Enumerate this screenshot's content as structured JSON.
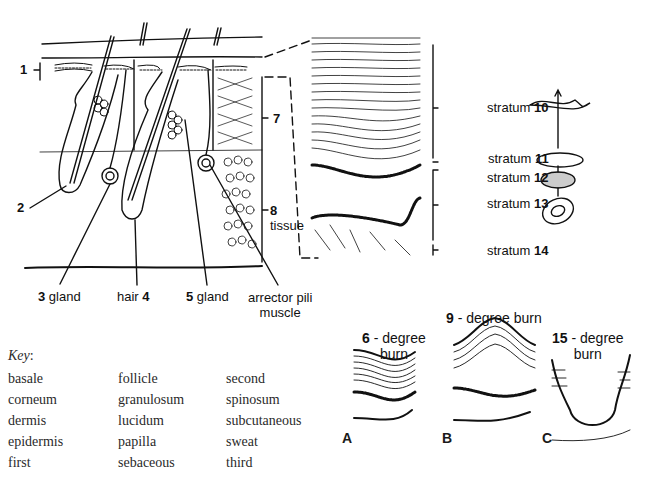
{
  "diagram": {
    "type": "skin anatomy labeling worksheet",
    "main_section": {
      "labels": [
        {
          "id": "1",
          "text": "",
          "number": "1"
        },
        {
          "id": "2",
          "text": "",
          "number": "2"
        },
        {
          "id": "3",
          "text": "gland",
          "number": "3"
        },
        {
          "id": "4",
          "text": "hair",
          "number": "4"
        },
        {
          "id": "5",
          "text": "gland",
          "number": "5"
        },
        {
          "id": "7",
          "text": "",
          "number": "7"
        },
        {
          "id": "8",
          "text": "tissue",
          "number": "8"
        },
        {
          "id": "arrector",
          "text": "arrector pili",
          "text2": "muscle"
        }
      ]
    },
    "epidermis_detail": {
      "strata": [
        {
          "prefix": "stratum",
          "number": "10"
        },
        {
          "prefix": "stratum",
          "number": "11"
        },
        {
          "prefix": "stratum",
          "number": "12"
        },
        {
          "prefix": "stratum",
          "number": "13"
        },
        {
          "prefix": "stratum",
          "number": "14"
        }
      ]
    },
    "burns": [
      {
        "letter": "A",
        "number": "6",
        "text": "- degree",
        "text2": "burn"
      },
      {
        "letter": "B",
        "number": "9",
        "text": "- degree burn"
      },
      {
        "letter": "C",
        "number": "15",
        "text": "- degree",
        "text2": "burn"
      }
    ],
    "key": {
      "title": "Key",
      "colon": ":",
      "columns": [
        [
          "basale",
          "corneum",
          "dermis",
          "epidermis",
          "first"
        ],
        [
          "follicle",
          "granulosum",
          "lucidum",
          "papilla",
          "sebaceous"
        ],
        [
          "second",
          "spinosum",
          "subcutaneous",
          "sweat",
          "third"
        ]
      ]
    }
  }
}
